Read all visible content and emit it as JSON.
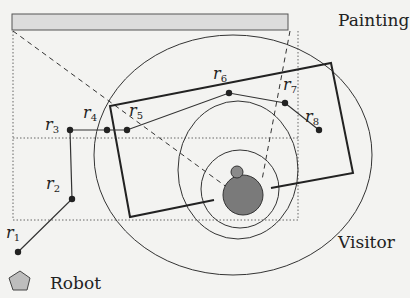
{
  "labels": {
    "painting": "Painting",
    "visitor": "Visitor",
    "robot": "Robot"
  },
  "waypoints": [
    {
      "name": "r",
      "index": "1",
      "x": 18,
      "y": 252
    },
    {
      "name": "r",
      "index": "2",
      "x": 72,
      "y": 199
    },
    {
      "name": "r",
      "index": "3",
      "x": 70,
      "y": 130
    },
    {
      "name": "r",
      "index": "4",
      "x": 107,
      "y": 130
    },
    {
      "name": "r",
      "index": "5",
      "x": 127,
      "y": 130
    },
    {
      "name": "r",
      "index": "6",
      "x": 229,
      "y": 93
    },
    {
      "name": "r",
      "index": "7",
      "x": 285,
      "y": 103
    },
    {
      "name": "r",
      "index": "8",
      "x": 319,
      "y": 130
    }
  ],
  "colors": {
    "background": "#f3f3f1",
    "ink": "#2a2a2a",
    "painting_fill": "#dcdcdc",
    "robot_fill": "#8a8a8a",
    "visitor_fill": "#7a7a7a"
  }
}
